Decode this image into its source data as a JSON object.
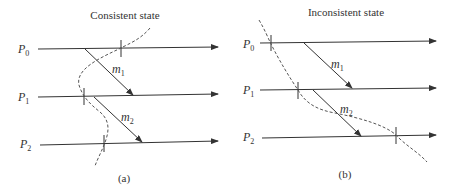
{
  "panels": [
    {
      "title": "Consistent state",
      "caption": "(a)",
      "processes": [
        "P0",
        "P1",
        "P2"
      ],
      "messages": [
        "m1",
        "m2"
      ]
    },
    {
      "title": "Inconsistent state",
      "caption": "(b)",
      "processes": [
        "P0",
        "P1",
        "P2"
      ],
      "messages": [
        "m1",
        "m2"
      ]
    }
  ],
  "labels": {
    "p": "P",
    "m": "m",
    "sub0": "0",
    "sub1": "1",
    "sub2": "2"
  }
}
